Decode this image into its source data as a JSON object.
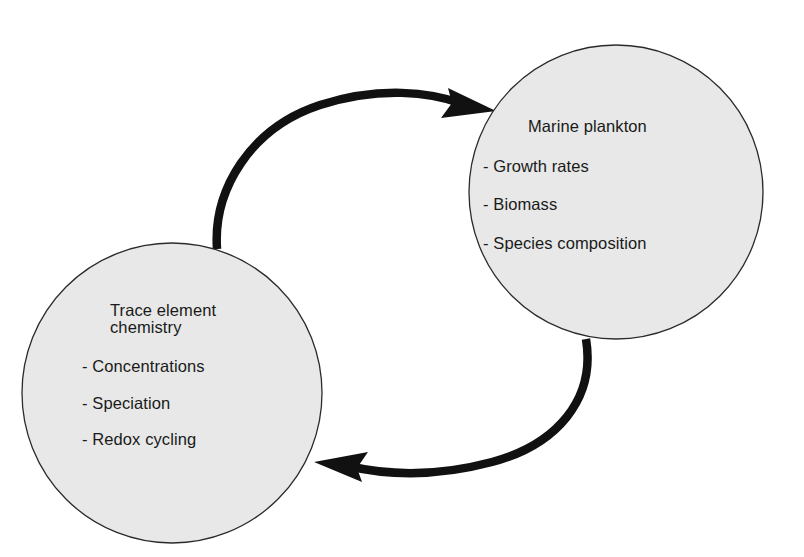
{
  "diagram": {
    "type": "cyclic-feedback-loop",
    "background_color": "#ffffff",
    "node_fill_color": "#e7e8e7",
    "node_stroke_color": "#2b2b2b",
    "arrow_color": "#111111",
    "nodes": [
      {
        "id": "marine-plankton",
        "title": "Marine plankton",
        "bullets": [
          "- Growth rates",
          "- Biomass",
          "- Species composition"
        ],
        "center": {
          "x": 616,
          "y": 192
        },
        "radius": 147
      },
      {
        "id": "trace-element-chemistry",
        "title_line1": "Trace element",
        "title_line2": "chemistry",
        "bullets": [
          "- Concentrations",
          "- Speciation",
          "- Redox cycling"
        ],
        "center": {
          "x": 172,
          "y": 393
        },
        "radius": 150
      }
    ],
    "arrows": [
      {
        "id": "chemistry-to-plankton",
        "from": "trace-element-chemistry",
        "to": "marine-plankton",
        "direction": "clockwise-top",
        "tip": {
          "x": 495,
          "y": 110
        }
      },
      {
        "id": "plankton-to-chemistry",
        "from": "marine-plankton",
        "to": "trace-element-chemistry",
        "direction": "clockwise-bottom",
        "tip": {
          "x": 317,
          "y": 463
        }
      }
    ]
  }
}
